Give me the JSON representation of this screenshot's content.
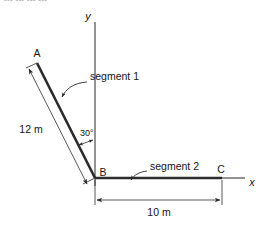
{
  "figure": {
    "type": "engineering-diagram",
    "top_cut_text": "--- --- --- ---",
    "background_color": "#ffffff",
    "line_color": "#2b2b2b",
    "axis_color": "#6f6f6f"
  },
  "axes": {
    "y_label": "y",
    "x_label": "x"
  },
  "points": {
    "a": "A",
    "b": "B",
    "c": "C"
  },
  "segments": {
    "one_label": "segment 1",
    "two_label": "segment 2"
  },
  "dimensions": {
    "segment1_length": "12 m",
    "segment2_length": "10 m",
    "angle": "30°"
  },
  "geometry": {
    "point_a": [
      37,
      63
    ],
    "point_b": [
      95,
      178
    ],
    "point_c": [
      222,
      178
    ],
    "y_axis_top": [
      95,
      22
    ],
    "x_axis_right": [
      245,
      178
    ],
    "angle_from_y_axis_deg": 30,
    "segment1_length_m": 12,
    "segment2_length_m": 10
  }
}
